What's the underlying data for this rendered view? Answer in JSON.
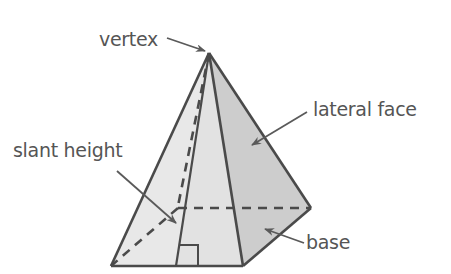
{
  "labels": {
    "vertex": "vertex",
    "lateral_face": "lateral face",
    "slant_height": "slant height",
    "base": "base"
  },
  "colors": {
    "edge": "#4a4a4a",
    "label_text": "#555555",
    "arrow": "#5a5a5a",
    "left_face": "#e6e6e6",
    "front_face": "#e0e0e0",
    "right_face": "#cfcfcf",
    "background": "#ffffff"
  }
}
